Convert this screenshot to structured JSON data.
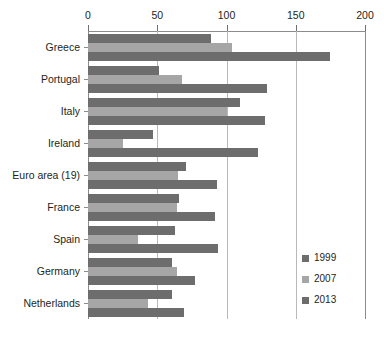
{
  "chart_data": {
    "type": "bar",
    "orientation": "horizontal",
    "title": "",
    "subtitle": "",
    "xlabel": "",
    "ylabel": "",
    "xlim": [
      0,
      200
    ],
    "xticks": [
      0,
      50,
      100,
      150,
      200
    ],
    "xtick_labels": [
      "0",
      "50",
      "100",
      "150",
      "200"
    ],
    "grid": true,
    "grid_axis": "x",
    "legend_position": "bottom-right",
    "categories": [
      "Greece",
      "Portugal",
      "Italy",
      "Ireland",
      "Euro area (19)",
      "France",
      "Spain",
      "Germany",
      "Netherlands"
    ],
    "series": [
      {
        "name": "1999",
        "color": "#6d6d6d",
        "values": [
          89,
          51,
          110,
          47,
          71,
          66,
          63,
          61,
          61
        ]
      },
      {
        "name": "2007",
        "color": "#a6a6a6",
        "values": [
          104,
          68,
          100,
          25,
          65,
          64,
          36,
          64,
          43
        ]
      },
      {
        "name": "2013",
        "color": "#6d6d6d",
        "values": [
          175,
          129,
          128,
          123,
          93,
          92,
          94,
          77,
          69
        ]
      }
    ]
  },
  "legend": {
    "items": [
      {
        "label": "1999"
      },
      {
        "label": "2007"
      },
      {
        "label": "2013"
      }
    ]
  }
}
